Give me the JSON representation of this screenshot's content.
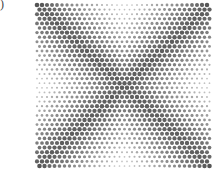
{
  "figure": {
    "panel_label": ")",
    "lattice": {
      "x0": 37,
      "y0": 5,
      "x1": 211,
      "y1": 167,
      "pitch_x": 5.0,
      "pitch_y": 4.6,
      "row_offset": 2.5,
      "dot_min_radius": 0.7,
      "dot_max_radius": 2.3,
      "color_dark": "#555555",
      "color_light": "#cfcfcf",
      "pattern": "X-diagonals darker; left/right mid-edges and top/bottom centers lighter; corner rows darkest"
    }
  }
}
